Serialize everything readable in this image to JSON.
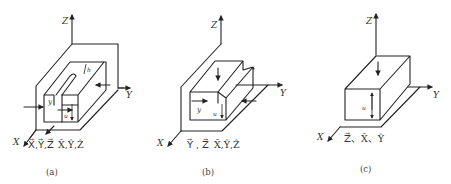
{
  "figure": {
    "panels": [
      {
        "id": "a",
        "caption": "(a)",
        "axes": {
          "x": "X",
          "y": "Y",
          "z": "Z"
        },
        "dimension_labels": [
          "y",
          "u",
          "h"
        ],
        "constrained_translations": "X⃗,Y⃗,Z⃗",
        "constrained_rotations": "X̂,Ŷ,Ẑ",
        "shape": "closed slot with fixture walls"
      },
      {
        "id": "b",
        "caption": "(b)",
        "axes": {
          "x": "X",
          "y": "Y",
          "z": "Z"
        },
        "dimension_labels": [
          "y",
          "u"
        ],
        "constrained_translations": "Y⃗ , Z⃗",
        "constrained_rotations": "X̂,Ŷ,Ẑ",
        "shape": "step / through-slot block"
      },
      {
        "id": "c",
        "caption": "(c)",
        "axes": {
          "x": "X",
          "y": "Y",
          "z": "Z"
        },
        "dimension_labels": [
          "u"
        ],
        "constrained_translations": "Z⃗",
        "constrained_rotations": "X̂,Ŷ",
        "dof_text": "Z⃗、X̂、Ŷ",
        "shape": "rectangular block on plane"
      }
    ],
    "colors": {
      "line": "#222222",
      "background": "#ffffff"
    }
  },
  "labels": {
    "a_z": "Z",
    "a_y": "Y",
    "a_x": "X",
    "a_dof1": "X⃗,Y⃗,Z⃗",
    "a_dof2": "X̂,Ŷ,Ẑ",
    "a_dim_y": "y",
    "a_dim_u": "u",
    "a_dim_h": "h",
    "a_cap": "(a)",
    "b_z": "Z",
    "b_y": "Y",
    "b_x": "X",
    "b_dof1": "Y⃗ , Z⃗",
    "b_dof2": "X̂,Ŷ,Ẑ",
    "b_dim_y": "y",
    "b_dim_u": "u",
    "b_cap": "(b)",
    "c_z": "Z",
    "c_y": "Y",
    "c_x": "X",
    "c_dof": "Z⃗、X̂、Ŷ",
    "c_dim_u": "u",
    "c_cap": "(c)"
  }
}
